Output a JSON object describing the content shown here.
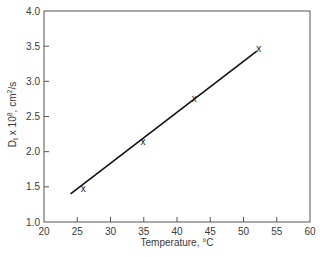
{
  "chart_data": {
    "type": "scatter",
    "title": "",
    "xlabel": "Temperature, °C",
    "ylabel": "Dt x 10^8, cm²/s",
    "ylabel_parts": {
      "main": "D",
      "sub": "t",
      "mid": " x 10",
      "sup": "8",
      "tail": ", cm",
      "sup2": "2",
      "end": "/s"
    },
    "xlim": [
      20,
      60
    ],
    "ylim": [
      1.0,
      4.0
    ],
    "xticks": [
      20,
      25,
      30,
      35,
      40,
      45,
      50,
      55,
      60
    ],
    "xtick_labels": [
      "20",
      "25",
      "30",
      "35",
      "40",
      "45",
      "50",
      "55",
      "60"
    ],
    "yticks": [
      1.0,
      1.5,
      2.0,
      2.5,
      3.0,
      3.5,
      4.0
    ],
    "ytick_labels": [
      "1.0",
      "1.5",
      "2.0",
      "2.5",
      "3.0",
      "3.5",
      "4.0"
    ],
    "grid": false,
    "legend": null,
    "marker": "x",
    "series": [
      {
        "name": "Measured",
        "style": "marker",
        "x": [
          25.9,
          34.9,
          42.6,
          52.3
        ],
        "y": [
          1.48,
          2.15,
          2.76,
          3.46
        ]
      },
      {
        "name": "Linear fit",
        "style": "line",
        "x": [
          24.0,
          52.0
        ],
        "y": [
          1.4,
          3.43
        ]
      }
    ]
  }
}
